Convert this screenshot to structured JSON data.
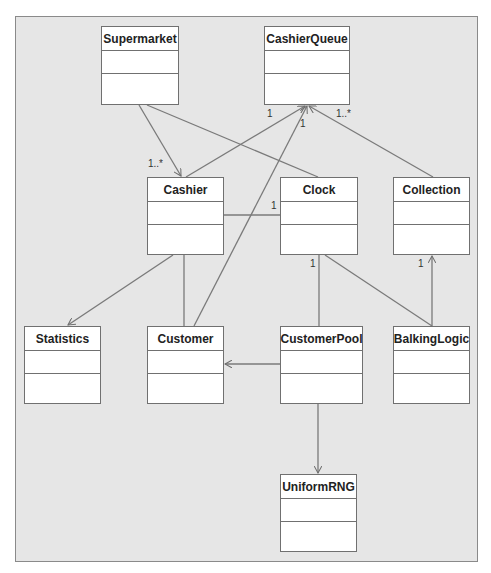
{
  "diagram": {
    "type": "uml-class-diagram",
    "classes": [
      {
        "id": "supermarket",
        "name": "Supermarket",
        "attributes": [],
        "operations": []
      },
      {
        "id": "cashierqueue",
        "name": "CashierQueue",
        "attributes": [],
        "operations": []
      },
      {
        "id": "cashier",
        "name": "Cashier",
        "attributes": [],
        "operations": []
      },
      {
        "id": "clock",
        "name": "Clock",
        "attributes": [],
        "operations": []
      },
      {
        "id": "collection",
        "name": "Collection",
        "attributes": [],
        "operations": []
      },
      {
        "id": "statistics",
        "name": "Statistics",
        "attributes": [],
        "operations": []
      },
      {
        "id": "customer",
        "name": "Customer",
        "attributes": [],
        "operations": []
      },
      {
        "id": "customerpool",
        "name": "CustomerPool",
        "attributes": [],
        "operations": []
      },
      {
        "id": "balkinglogic",
        "name": "BalkingLogic",
        "attributes": [],
        "operations": []
      },
      {
        "id": "uniformrng",
        "name": "UniformRNG",
        "attributes": [],
        "operations": []
      }
    ],
    "relationships": [
      {
        "from": "Supermarket",
        "to": "Cashier",
        "kind": "directed-association",
        "target_multiplicity": "1..*"
      },
      {
        "from": "Supermarket",
        "to": "Clock",
        "kind": "association"
      },
      {
        "from": "Cashier",
        "to": "CashierQueue",
        "kind": "directed-association",
        "target_multiplicity": "1"
      },
      {
        "from": "Customer",
        "to": "CashierQueue",
        "kind": "directed-association",
        "target_multiplicity": "1"
      },
      {
        "from": "Collection",
        "to": "CashierQueue",
        "kind": "directed-association",
        "target_multiplicity": "1..*"
      },
      {
        "from": "Cashier",
        "to": "Clock",
        "kind": "association",
        "target_multiplicity": "1"
      },
      {
        "from": "Cashier",
        "to": "Statistics",
        "kind": "directed-association"
      },
      {
        "from": "Cashier",
        "to": "Customer",
        "kind": "association"
      },
      {
        "from": "Clock",
        "to": "CustomerPool",
        "kind": "association",
        "source_multiplicity": "1"
      },
      {
        "from": "Clock",
        "to": "BalkingLogic",
        "kind": "association"
      },
      {
        "from": "BalkingLogic",
        "to": "Collection",
        "kind": "directed-association",
        "target_multiplicity": "1"
      },
      {
        "from": "CustomerPool",
        "to": "Customer",
        "kind": "directed-association"
      },
      {
        "from": "CustomerPool",
        "to": "UniformRNG",
        "kind": "directed-association"
      }
    ],
    "labels": {
      "supermarket_cashier_mult": "1..*",
      "cashier_cq_mult": "1",
      "customer_cq_mult": "1",
      "collection_cq_mult": "1..*",
      "cashier_clock_mult": "1",
      "clock_customerpool_mult": "1",
      "balking_collection_mult": "1"
    },
    "colors": {
      "canvas": "#e6e6e6",
      "border": "#707070",
      "line": "#7a7a7a",
      "box": "#ffffff"
    }
  }
}
